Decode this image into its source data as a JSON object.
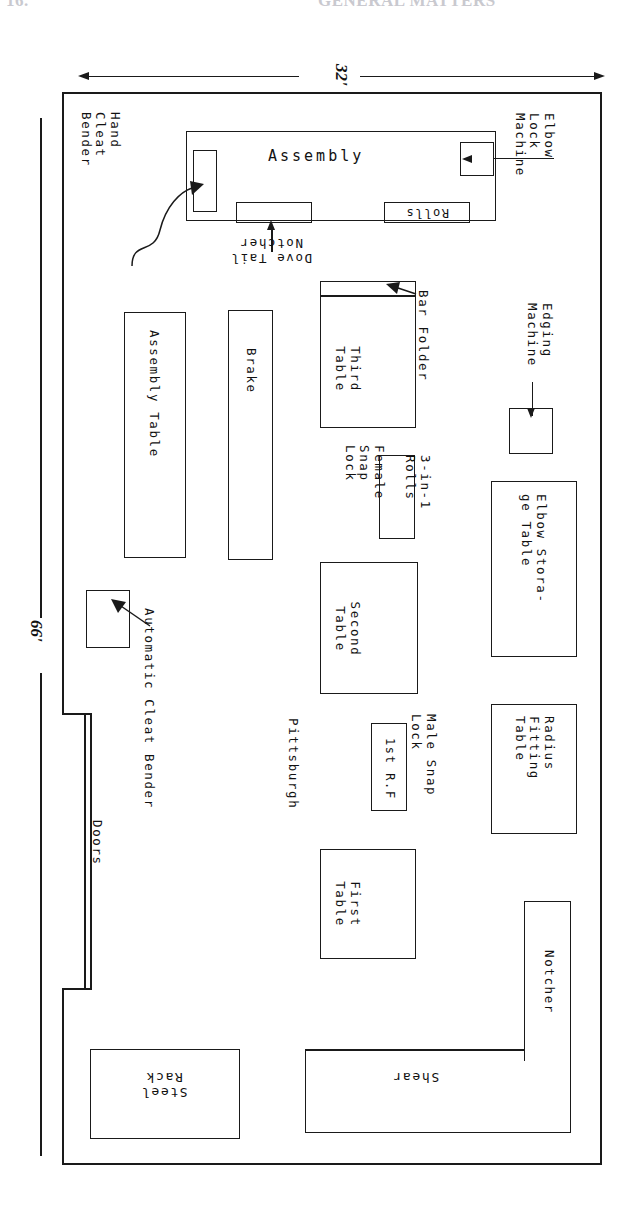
{
  "page": {
    "header_left": "16.",
    "header_right": "GENERAL MATTERS"
  },
  "dimensions": {
    "width_label": "32'",
    "length_label": "66'"
  },
  "plan": {
    "openings": [
      {
        "name": "doors",
        "label": "Doors"
      }
    ],
    "areas": [
      {
        "name": "assembly",
        "label": "Assembly"
      }
    ],
    "equipment": [
      {
        "name": "hand-cleat-bender",
        "label": "Hand\nCleat\nBender"
      },
      {
        "name": "elbow-lock-machine",
        "label": "Elbow\nLock\nMachine"
      },
      {
        "name": "dove-tail-notcher",
        "label": "Dove Tail\nNotcher"
      },
      {
        "name": "rolls",
        "label": "Rolls"
      },
      {
        "name": "edging-machine",
        "label": "Edging\nMachine"
      },
      {
        "name": "bar-folder",
        "label": "Bar Folder"
      },
      {
        "name": "third-table",
        "label": "Third\nTable"
      },
      {
        "name": "brake",
        "label": "Brake"
      },
      {
        "name": "assembly-table",
        "label": "Assembly Table"
      },
      {
        "name": "female-snap-lock",
        "label": "Female\nSnap\nLock"
      },
      {
        "name": "three-in-one-rolls",
        "label": "3-in-1\nRolls"
      },
      {
        "name": "elbow-storage-table",
        "label": "Elbow Stora-\nge Table"
      },
      {
        "name": "second-table",
        "label": "Second\nTable"
      },
      {
        "name": "radius-fitting-table",
        "label": "Radius\nFitting\nTable"
      },
      {
        "name": "male-snap-lock",
        "label": "Male Snap\nLock"
      },
      {
        "name": "first-rf",
        "label": "1st R.F"
      },
      {
        "name": "pittsburgh",
        "label": "Pittsburgh"
      },
      {
        "name": "automatic-cleat-bender",
        "label": "Automatic Cleat Bender"
      },
      {
        "name": "first-table",
        "label": "First\nTable"
      },
      {
        "name": "notcher",
        "label": "Notcher"
      },
      {
        "name": "shear",
        "label": "Shear"
      },
      {
        "name": "steel-rack",
        "label": "Steel\nRack"
      }
    ]
  }
}
